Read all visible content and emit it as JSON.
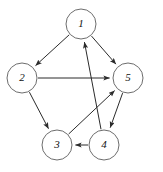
{
  "figure": {
    "background_color": "#ffffff",
    "node_stroke_color": "#6d6d6d",
    "node_fill_color": "#ffffff",
    "edge_color": "#2b2b2b",
    "label_color": "#111111",
    "width": 163,
    "height": 172
  },
  "graph_data": {
    "type": "diagram",
    "directed": true,
    "node_radius": 15,
    "nodes": [
      {
        "id": "1",
        "label": "1",
        "cx": 81,
        "cy": 24
      },
      {
        "id": "2",
        "label": "2",
        "cx": 22,
        "cy": 78
      },
      {
        "id": "3",
        "label": "3",
        "cx": 57,
        "cy": 145
      },
      {
        "id": "4",
        "label": "4",
        "cx": 104,
        "cy": 145
      },
      {
        "id": "5",
        "label": "5",
        "cx": 128,
        "cy": 78
      }
    ],
    "edges": [
      {
        "from": "1",
        "to": "2",
        "label": "1 to 2"
      },
      {
        "from": "1",
        "to": "5",
        "label": "1 to 5"
      },
      {
        "from": "2",
        "to": "5",
        "label": "2 to 5"
      },
      {
        "from": "2",
        "to": "3",
        "label": "2 to 3"
      },
      {
        "from": "3",
        "to": "5",
        "label": "3 to 5"
      },
      {
        "from": "4",
        "to": "1",
        "label": "4 to 1"
      },
      {
        "from": "4",
        "to": "3",
        "label": "4 to 3"
      },
      {
        "from": "5",
        "to": "4",
        "label": "5 to 4"
      }
    ]
  }
}
